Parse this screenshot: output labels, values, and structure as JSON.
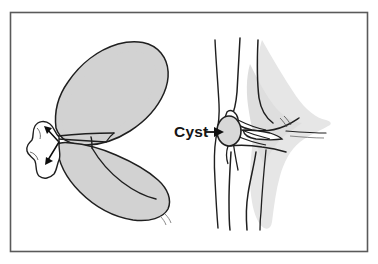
{
  "figure": {
    "border_color": "#5a5a5a",
    "background_color": "#ffffff",
    "ink_color": "#1a1a1a"
  },
  "labels": {
    "cyst": "Cyst"
  },
  "left_panel": {
    "name": "meniscus-top-view",
    "meniscus_fill": "#d2d2d2",
    "meniscus_outline": "#1f1f1f",
    "cyst_fill": "#ffffff",
    "cyst_outline": "#1f1f1f",
    "arrow_color": "#0d0d0d",
    "arrow_count": 2,
    "tear_description": "horizontal cleavage tear"
  },
  "right_panel": {
    "name": "knee-sagittal-view",
    "soft_tissue_fill": "#e6e6e6",
    "bone_fill": "#ffffff",
    "bone_outline": "#1f1f1f",
    "cyst_fill": "#d8d8d8",
    "pointer_color": "#111111"
  }
}
